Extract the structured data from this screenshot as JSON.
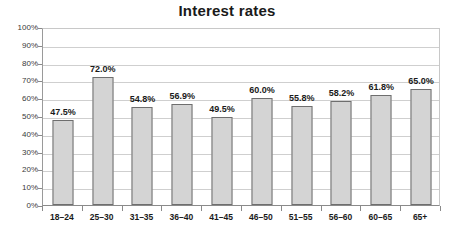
{
  "chart_data": {
    "type": "bar",
    "title": "Interest rates",
    "xlabel": "",
    "ylabel": "",
    "categories": [
      "18–24",
      "25–30",
      "31–35",
      "36–40",
      "41–45",
      "46–50",
      "51–55",
      "56–60",
      "60–65",
      "65+"
    ],
    "values": [
      47.5,
      72.0,
      54.8,
      56.9,
      49.5,
      60.0,
      55.8,
      58.2,
      61.8,
      65.0
    ],
    "data_labels": [
      "47.5%",
      "72.0%",
      "54.8%",
      "56.9%",
      "49.5%",
      "60.0%",
      "55.8%",
      "58.2%",
      "61.8%",
      "65.0%"
    ],
    "ylim": [
      0,
      100
    ],
    "ytick_values": [
      0,
      10,
      20,
      30,
      40,
      50,
      60,
      70,
      80,
      90,
      100
    ],
    "ytick_labels": [
      "0%",
      "10%",
      "20%",
      "30%",
      "40%",
      "50%",
      "60%",
      "70%",
      "80%",
      "90%",
      "100%"
    ],
    "grid": true,
    "legend": false,
    "legend_position": "none",
    "bar_fill_color": "#d4d4d4",
    "bar_border_color": "#6e6e6e",
    "gridline_color": "#cfcfcf",
    "axis_color": "#8a8a8a",
    "title_color": "#1a1a1a",
    "background_color": "#ffffff"
  }
}
